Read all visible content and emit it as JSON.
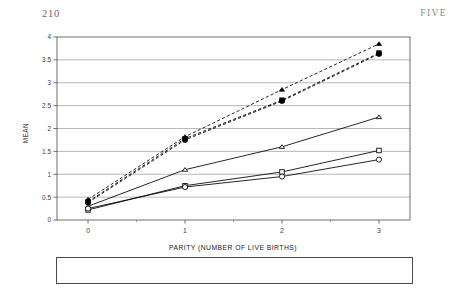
{
  "running_head": {
    "page_number": "210",
    "chapter_label": "FIVE"
  },
  "chart_data": {
    "type": "line",
    "title": "",
    "xlabel": "PARITY (NUMBER OF LIVE BIRTHS)",
    "ylabel": "MEAN",
    "x": [
      0,
      1,
      2,
      3
    ],
    "xtick_labels": [
      "0",
      "1",
      "2",
      "3"
    ],
    "ytick_labels": [
      "0",
      "0.5",
      "1",
      "1.5",
      "2",
      "2.5",
      "3",
      "3.5",
      "4"
    ],
    "ylim": [
      0,
      4
    ],
    "xlim": [
      -0.32,
      3.32
    ],
    "ytick_step": 0.5,
    "grid": "horizontal",
    "legend_position": "below-axis",
    "series": [
      {
        "name": "Black Unwanted Pregnancy",
        "marker": "open-triangle",
        "line": "solid",
        "color": "#000000",
        "values": [
          0.3,
          1.1,
          1.6,
          2.25
        ]
      },
      {
        "name": "Hispanic Unwanted Pregnancy",
        "marker": "open-square",
        "line": "solid",
        "color": "#000000",
        "values": [
          0.22,
          0.75,
          1.05,
          1.52
        ]
      },
      {
        "name": "White Unwanted Pregnancy",
        "marker": "open-circle",
        "line": "solid",
        "color": "#000000",
        "values": [
          0.25,
          0.72,
          0.95,
          1.32
        ]
      },
      {
        "name": "Black Pregnancy",
        "marker": "filled-triangle",
        "line": "dashed",
        "color": "#000000",
        "values": [
          0.45,
          1.82,
          2.85,
          3.85
        ]
      },
      {
        "name": "Hispanic Pregnancy",
        "marker": "filled-square",
        "line": "dashed",
        "color": "#000000",
        "values": [
          0.4,
          1.78,
          2.62,
          3.65
        ]
      },
      {
        "name": "White Pregnancy",
        "marker": "filled-circle",
        "line": "dashed",
        "color": "#000000",
        "values": [
          0.38,
          1.75,
          2.6,
          3.63
        ]
      }
    ]
  },
  "legend": {
    "rows": [
      [
        {
          "label": "Black Unwanted Pregnancy",
          "marker": "open-triangle",
          "line": "solid"
        },
        {
          "label": "Hispanic Unwanted Pregnancy",
          "marker": "open-square",
          "line": "solid"
        },
        {
          "label": "White Unwanted Pregnancy",
          "marker": "open-circle",
          "line": "solid"
        }
      ],
      [
        {
          "label": "Black Pregnancy",
          "marker": "filled-triangle",
          "line": "dashed"
        },
        {
          "label": "Hispanic Pregnancy",
          "marker": "filled-square",
          "line": "dashed"
        },
        {
          "label": "White Pregnancy",
          "marker": "filled-circle",
          "line": "dashed"
        }
      ]
    ]
  }
}
